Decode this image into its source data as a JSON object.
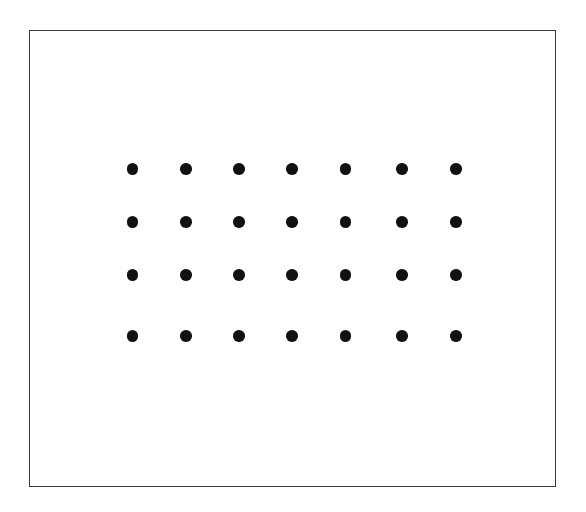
{
  "figure": {
    "title": "",
    "caption": "",
    "canvas": {
      "width": 586,
      "height": 512,
      "background_color": "#ffffff"
    },
    "frame": {
      "name": "bounding-rectangle",
      "x": 29,
      "y": 30,
      "width": 527,
      "height": 457,
      "stroke_color": "#3a3a3a",
      "stroke_width": 1.5,
      "fill_color": "#ffffff"
    }
  },
  "chart_data": {
    "type": "scatter",
    "title": "",
    "subtitle": "",
    "xlabel": "",
    "ylabel": "",
    "grid": false,
    "legend_position": "none",
    "marker": {
      "shape": "circle",
      "color": "#111111",
      "diameter_px": 11.5
    },
    "layout": {
      "rows": 4,
      "columns": 7,
      "total_points": 28,
      "column_centers_px": [
        131.5,
        185.0,
        238.0,
        291.0,
        344.5,
        401.0,
        455.0
      ],
      "row_centers_px": [
        168.0,
        221.0,
        274.0,
        335.0
      ],
      "column_spacing_px": 53.9,
      "row_spacing_px": 53.0
    },
    "xlim": [
      29,
      556
    ],
    "ylim": [
      30,
      487
    ],
    "x": [
      131.5,
      185.0,
      238.0,
      291.0,
      344.5,
      401.0,
      455.0,
      131.5,
      185.0,
      238.0,
      291.0,
      344.5,
      401.0,
      455.0,
      131.5,
      185.0,
      238.0,
      291.0,
      344.5,
      401.0,
      455.0,
      131.5,
      185.0,
      238.0,
      291.0,
      344.5,
      401.0,
      455.0
    ],
    "y": [
      168.0,
      168.0,
      168.0,
      168.0,
      168.0,
      168.0,
      168.0,
      221.0,
      221.0,
      221.0,
      221.0,
      221.0,
      221.0,
      221.0,
      274.0,
      274.0,
      274.0,
      274.0,
      274.0,
      274.0,
      274.0,
      335.0,
      335.0,
      335.0,
      335.0,
      335.0,
      335.0,
      335.0
    ],
    "points": [
      {
        "row": 1,
        "col": 1,
        "cx": 131.5,
        "cy": 168.0
      },
      {
        "row": 1,
        "col": 2,
        "cx": 185.0,
        "cy": 168.0
      },
      {
        "row": 1,
        "col": 3,
        "cx": 238.0,
        "cy": 168.0
      },
      {
        "row": 1,
        "col": 4,
        "cx": 291.0,
        "cy": 168.0
      },
      {
        "row": 1,
        "col": 5,
        "cx": 344.5,
        "cy": 168.0
      },
      {
        "row": 1,
        "col": 6,
        "cx": 401.0,
        "cy": 168.0
      },
      {
        "row": 1,
        "col": 7,
        "cx": 455.0,
        "cy": 168.0
      },
      {
        "row": 2,
        "col": 1,
        "cx": 131.5,
        "cy": 221.0
      },
      {
        "row": 2,
        "col": 2,
        "cx": 185.0,
        "cy": 221.0
      },
      {
        "row": 2,
        "col": 3,
        "cx": 238.0,
        "cy": 221.0
      },
      {
        "row": 2,
        "col": 4,
        "cx": 291.0,
        "cy": 221.0
      },
      {
        "row": 2,
        "col": 5,
        "cx": 344.5,
        "cy": 221.0
      },
      {
        "row": 2,
        "col": 6,
        "cx": 401.0,
        "cy": 221.0
      },
      {
        "row": 2,
        "col": 7,
        "cx": 455.0,
        "cy": 221.0
      },
      {
        "row": 3,
        "col": 1,
        "cx": 131.5,
        "cy": 274.0
      },
      {
        "row": 3,
        "col": 2,
        "cx": 185.0,
        "cy": 274.0
      },
      {
        "row": 3,
        "col": 3,
        "cx": 238.0,
        "cy": 274.0
      },
      {
        "row": 3,
        "col": 4,
        "cx": 291.0,
        "cy": 274.0
      },
      {
        "row": 3,
        "col": 5,
        "cx": 344.5,
        "cy": 274.0
      },
      {
        "row": 3,
        "col": 6,
        "cx": 401.0,
        "cy": 274.0
      },
      {
        "row": 3,
        "col": 7,
        "cx": 455.0,
        "cy": 274.0
      },
      {
        "row": 4,
        "col": 1,
        "cx": 131.5,
        "cy": 335.0
      },
      {
        "row": 4,
        "col": 2,
        "cx": 185.0,
        "cy": 335.0
      },
      {
        "row": 4,
        "col": 3,
        "cx": 238.0,
        "cy": 335.0
      },
      {
        "row": 4,
        "col": 4,
        "cx": 291.0,
        "cy": 335.0
      },
      {
        "row": 4,
        "col": 5,
        "cx": 344.5,
        "cy": 335.0
      },
      {
        "row": 4,
        "col": 6,
        "cx": 401.0,
        "cy": 335.0
      },
      {
        "row": 4,
        "col": 7,
        "cx": 455.0,
        "cy": 335.0
      }
    ]
  }
}
